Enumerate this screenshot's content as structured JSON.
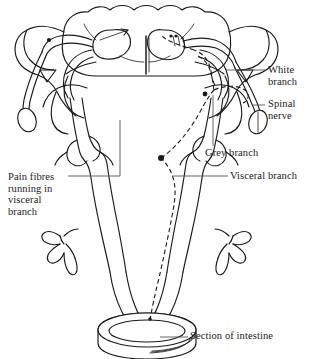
{
  "figure": {
    "type": "anatomical-line-diagram",
    "background_color": "#ffffff",
    "stroke_color": "#1a1a1a",
    "dash_color": "#1a1a1a",
    "width": 311,
    "height": 359
  },
  "labels": {
    "white_branch": "White\nbranch",
    "spinal_nerve": "Spinal\nnerve",
    "grey_branch": "Grey branch",
    "visceral_branch": "Visceral branch",
    "pain_fibres": "Pain fibres\nrunning in\nvisceral\nbranch",
    "section_of_intestine": "Section of intestine"
  },
  "structures": [
    {
      "name": "spinal-cord-cross-section",
      "description": "butterfly grey matter within white matter, midline fissure"
    },
    {
      "name": "dorsal-root-ganglion-left",
      "description": "left dorsal root with ganglion dot"
    },
    {
      "name": "dorsal-root-ganglion-right",
      "description": "right dorsal root with ganglion dot"
    },
    {
      "name": "spinal-nerve-stump-right",
      "description": "cut end of spinal nerve, elliptical cross-section"
    },
    {
      "name": "spinal-nerve-stump-left",
      "description": "cut end of spinal nerve, elliptical cross-section"
    },
    {
      "name": "sympathetic-ganglion-left",
      "description": "paravertebral ganglion on left sympathetic trunk"
    },
    {
      "name": "sympathetic-ganglion-right",
      "description": "paravertebral ganglion on right sympathetic trunk with synapse dot"
    },
    {
      "name": "prevertebral-plexus-left",
      "description": "branching plexus on left splanchnic nerve"
    },
    {
      "name": "prevertebral-plexus-right",
      "description": "branching plexus on right splanchnic nerve"
    },
    {
      "name": "intestine-section",
      "description": "cylindrical cut segment of intestine at base"
    },
    {
      "name": "pain-fibre-dashed-path",
      "description": "dashed line traced from intestine up visceral branch through sympathetic trunk and white branch into dorsal horn"
    }
  ]
}
